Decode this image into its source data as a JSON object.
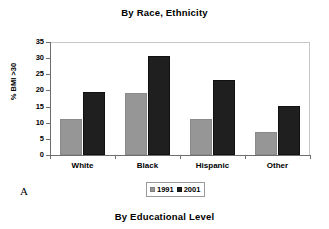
{
  "figure": {
    "panel_letter": "A",
    "top_title": "By Race, Ethnicity",
    "bottom_title": "By Educational Level"
  },
  "chart_data": {
    "type": "bar",
    "title": "By Race, Ethnicity",
    "xlabel": "",
    "ylabel": "% BMI >30",
    "ylim": [
      0,
      35
    ],
    "yticks": [
      0,
      5,
      10,
      15,
      20,
      25,
      30,
      35
    ],
    "ytick_labels": [
      "0",
      "5",
      "10",
      "15",
      "20",
      "25",
      "30",
      "35"
    ],
    "grid": false,
    "legend_position": "bottom-center",
    "categories": [
      "White",
      "Black",
      "Hispanic",
      "Other"
    ],
    "series": [
      {
        "name": "1991",
        "color": "#969696",
        "values": [
          11.3,
          19.1,
          11.3,
          7.0
        ]
      },
      {
        "name": "2001",
        "color": "#1f1f1f",
        "values": [
          19.4,
          30.7,
          23.1,
          15.1
        ]
      }
    ]
  }
}
